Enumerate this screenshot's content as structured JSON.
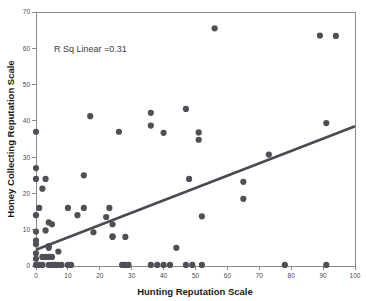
{
  "chart_data": {
    "type": "scatter",
    "title": "",
    "xlabel": "Hunting Reputation Scale",
    "ylabel": "Honey Collecting Reputation Scale",
    "xlim": [
      0,
      100
    ],
    "ylim": [
      0,
      70
    ],
    "xticks": [
      0,
      10,
      20,
      30,
      40,
      50,
      60,
      70,
      80,
      90,
      100
    ],
    "yticks": [
      0,
      10,
      20,
      30,
      40,
      50,
      60,
      70
    ],
    "grid": false,
    "legend": null,
    "annotations": [
      {
        "text": "R Sq Linear =0.31",
        "x": 12,
        "y": 60
      }
    ],
    "r_squared": 0.31,
    "marker": {
      "shape": "circle",
      "color": "#4f4f56",
      "size": 3.1
    },
    "fit_line": {
      "type": "linear",
      "color": "#4a4a52",
      "x_start": 0,
      "y_start": 4.5,
      "x_end": 100,
      "y_end": 38.5
    },
    "points": [
      [
        0,
        37
      ],
      [
        0,
        27
      ],
      [
        0,
        24
      ],
      [
        0,
        14
      ],
      [
        0,
        9.5
      ],
      [
        0,
        7
      ],
      [
        0,
        6
      ],
      [
        0,
        3.5
      ],
      [
        0,
        2
      ],
      [
        0,
        0.3
      ],
      [
        1,
        16
      ],
      [
        1,
        0.3
      ],
      [
        2,
        21.3
      ],
      [
        2,
        2.5
      ],
      [
        2,
        0.3
      ],
      [
        3,
        24
      ],
      [
        3,
        9.8
      ],
      [
        3,
        2.5
      ],
      [
        4,
        12
      ],
      [
        4,
        5.5
      ],
      [
        4,
        5
      ],
      [
        4,
        2.5
      ],
      [
        4,
        0.3
      ],
      [
        5,
        11.5
      ],
      [
        5,
        2.5
      ],
      [
        5,
        0.3
      ],
      [
        6,
        0.3
      ],
      [
        7,
        4
      ],
      [
        7,
        0.3
      ],
      [
        8,
        0.3
      ],
      [
        10,
        16
      ],
      [
        10,
        0.3
      ],
      [
        11,
        0.3
      ],
      [
        13,
        14
      ],
      [
        15,
        25
      ],
      [
        15,
        16
      ],
      [
        17,
        41.3
      ],
      [
        18,
        9.3
      ],
      [
        22,
        13.5
      ],
      [
        23,
        16
      ],
      [
        24,
        8.2
      ],
      [
        24,
        8
      ],
      [
        24,
        11.5
      ],
      [
        26,
        37
      ],
      [
        27,
        0.3
      ],
      [
        28,
        8
      ],
      [
        28,
        0.3
      ],
      [
        29,
        0.3
      ],
      [
        36,
        42.2
      ],
      [
        36,
        38.7
      ],
      [
        36,
        0.3
      ],
      [
        38,
        0.3
      ],
      [
        40,
        36.7
      ],
      [
        40,
        0.3
      ],
      [
        42,
        0.3
      ],
      [
        44,
        5
      ],
      [
        47,
        43.3
      ],
      [
        47,
        0.3
      ],
      [
        48,
        24
      ],
      [
        49,
        0.3
      ],
      [
        51,
        36.8
      ],
      [
        51,
        34.8
      ],
      [
        52,
        13.7
      ],
      [
        52,
        0.3
      ],
      [
        56,
        65.5
      ],
      [
        65,
        23.2
      ],
      [
        65,
        18.5
      ],
      [
        73,
        30.7
      ],
      [
        78,
        0.3
      ],
      [
        89,
        63.5
      ],
      [
        91,
        39.4
      ],
      [
        91,
        0.3
      ],
      [
        94,
        63.4
      ]
    ]
  }
}
